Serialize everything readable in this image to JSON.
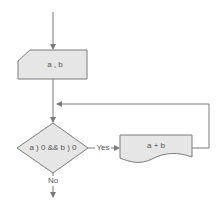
{
  "flowchart": {
    "input_node": {
      "label": "a , b",
      "shape": "manual-input"
    },
    "decision_node": {
      "label": "a ) 0 && b ) 0",
      "shape": "diamond"
    },
    "process_node": {
      "label": "a + b",
      "shape": "document"
    },
    "yes_label": "Yes",
    "no_label": "No"
  },
  "colors": {
    "line": "#7a7a7a",
    "fill": "#e6e6e6",
    "text": "#555555"
  }
}
